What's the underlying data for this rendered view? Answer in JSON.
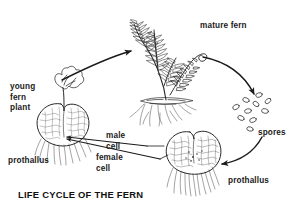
{
  "figure": {
    "title": "LIFE CYCLE OF THE FERN",
    "type": "cyclical biological life-cycle diagram",
    "background_color": "#ffffff",
    "ink_color": "#1a1a1a",
    "labels": {
      "mature_fern": "mature fern",
      "young_fern_plant": "young\nfern\nplant",
      "prothallus_left": "prothallus",
      "male_cell": "male\ncell",
      "female_cell": "female\ncell",
      "spores": "spores",
      "prothallus_right": "prothallus"
    },
    "stages": [
      {
        "name": "mature-fern",
        "label": "mature fern",
        "position": "top-center"
      },
      {
        "name": "spores",
        "label": "spores",
        "position": "right"
      },
      {
        "name": "prothallus-right",
        "label": "prothallus",
        "position": "bottom-center"
      },
      {
        "name": "young-fern-plant",
        "label": "young fern plant",
        "position": "left"
      }
    ],
    "arrows": [
      {
        "name": "arrow-young-to-mature",
        "from": "young fern plant",
        "to": "mature fern"
      },
      {
        "name": "arrow-mature-to-spores",
        "from": "mature fern",
        "to": "spores"
      },
      {
        "name": "arrow-spores-to-prothallus",
        "from": "spores",
        "to": "prothallus"
      },
      {
        "name": "arrow-prothallus-to-young",
        "from": "prothallus (male cell + female cell)",
        "to": "young fern plant"
      }
    ],
    "spore_count": 10
  }
}
